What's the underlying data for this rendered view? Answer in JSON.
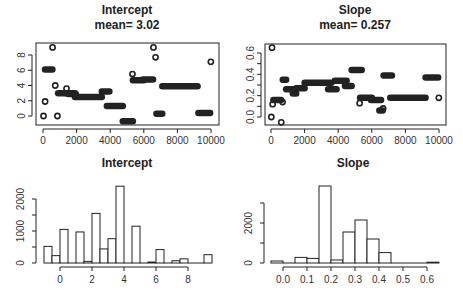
{
  "chart_data": [
    {
      "type": "scatter",
      "title": "Intercept",
      "subtitle": "mean= 3.02",
      "xlabel": "",
      "ylabel": "",
      "xlim": [
        0,
        10000
      ],
      "ylim": [
        -0.5,
        9.3
      ],
      "xticks": [
        0,
        2000,
        4000,
        6000,
        8000,
        10000
      ],
      "yticks": [
        0,
        2,
        4,
        6,
        8
      ],
      "grid": false,
      "segments": [
        {
          "x0": 0,
          "x1": 60,
          "y": 0.0
        },
        {
          "x0": 100,
          "x1": 150,
          "y": 1.9
        },
        {
          "x0": 120,
          "x1": 560,
          "y": 6.1
        },
        {
          "x0": 540,
          "x1": 600,
          "y": 9.0
        },
        {
          "x0": 680,
          "x1": 780,
          "y": 4.0
        },
        {
          "x0": 800,
          "x1": 920,
          "y": 0.0
        },
        {
          "x0": 900,
          "x1": 1900,
          "y": 3.0
        },
        {
          "x0": 1350,
          "x1": 1450,
          "y": 3.6
        },
        {
          "x0": 1500,
          "x1": 1950,
          "y": 2.9
        },
        {
          "x0": 1900,
          "x1": 3500,
          "y": 2.5
        },
        {
          "x0": 3500,
          "x1": 3950,
          "y": 3.2
        },
        {
          "x0": 3800,
          "x1": 4750,
          "y": 1.3
        },
        {
          "x0": 4750,
          "x1": 5350,
          "y": -0.7
        },
        {
          "x0": 5300,
          "x1": 5350,
          "y": 5.5
        },
        {
          "x0": 5350,
          "x1": 6000,
          "y": 4.7
        },
        {
          "x0": 5950,
          "x1": 6550,
          "y": 4.8
        },
        {
          "x0": 6500,
          "x1": 6650,
          "y": 9.0
        },
        {
          "x0": 6650,
          "x1": 6750,
          "y": 7.7
        },
        {
          "x0": 6750,
          "x1": 7100,
          "y": 0.3
        },
        {
          "x0": 7100,
          "x1": 9200,
          "y": 3.9
        },
        {
          "x0": 9250,
          "x1": 9950,
          "y": 0.4
        },
        {
          "x0": 9980,
          "x1": 10000,
          "y": 7.1
        }
      ]
    },
    {
      "type": "scatter",
      "title": "Slope",
      "subtitle": "mean= 0.257",
      "xlabel": "",
      "ylabel": "",
      "xlim": [
        0,
        10000
      ],
      "ylim": [
        -0.08,
        0.68
      ],
      "xticks": [
        0,
        2000,
        4000,
        6000,
        8000,
        10000
      ],
      "yticks": [
        0.0,
        0.2,
        0.4,
        0.6
      ],
      "ytick_minor": [
        0.1,
        0.3,
        0.5
      ],
      "grid": false,
      "segments": [
        {
          "x0": 0,
          "x1": 40,
          "y": 0.0
        },
        {
          "x0": 40,
          "x1": 80,
          "y": 0.65
        },
        {
          "x0": 80,
          "x1": 120,
          "y": 0.12
        },
        {
          "x0": 140,
          "x1": 600,
          "y": 0.16
        },
        {
          "x0": 580,
          "x1": 640,
          "y": -0.05
        },
        {
          "x0": 620,
          "x1": 760,
          "y": 0.14
        },
        {
          "x0": 700,
          "x1": 900,
          "y": 0.35
        },
        {
          "x0": 900,
          "x1": 1400,
          "y": 0.26
        },
        {
          "x0": 1300,
          "x1": 1500,
          "y": 0.22
        },
        {
          "x0": 1500,
          "x1": 2000,
          "y": 0.27
        },
        {
          "x0": 2000,
          "x1": 3600,
          "y": 0.32
        },
        {
          "x0": 3400,
          "x1": 3900,
          "y": 0.26
        },
        {
          "x0": 3800,
          "x1": 4500,
          "y": 0.34
        },
        {
          "x0": 4400,
          "x1": 4800,
          "y": 0.29
        },
        {
          "x0": 4800,
          "x1": 5400,
          "y": 0.44
        },
        {
          "x0": 5250,
          "x1": 5300,
          "y": 0.13
        },
        {
          "x0": 5300,
          "x1": 6000,
          "y": 0.18
        },
        {
          "x0": 5950,
          "x1": 6550,
          "y": 0.16
        },
        {
          "x0": 6450,
          "x1": 6650,
          "y": 0.06
        },
        {
          "x0": 6600,
          "x1": 6750,
          "y": 0.08
        },
        {
          "x0": 6700,
          "x1": 7200,
          "y": 0.39
        },
        {
          "x0": 7100,
          "x1": 9200,
          "y": 0.18
        },
        {
          "x0": 9200,
          "x1": 9950,
          "y": 0.37
        },
        {
          "x0": 9980,
          "x1": 10000,
          "y": 0.18
        }
      ]
    },
    {
      "type": "bar",
      "title": "Intercept",
      "xlabel": "Intercept",
      "ylabel": "Frequency",
      "xticks": [
        0,
        2,
        4,
        6,
        8
      ],
      "yticks": [
        0,
        1000,
        2000
      ],
      "ytick_minor": [
        500,
        1500
      ],
      "bin_width": 0.5,
      "bins": [
        {
          "x0": -1.0,
          "count": 520
        },
        {
          "x0": -0.5,
          "count": 230
        },
        {
          "x0": 0.0,
          "count": 1050
        },
        {
          "x0": 0.5,
          "count": 0
        },
        {
          "x0": 1.0,
          "count": 970
        },
        {
          "x0": 1.5,
          "count": 50
        },
        {
          "x0": 2.0,
          "count": 1550
        },
        {
          "x0": 2.5,
          "count": 440
        },
        {
          "x0": 3.0,
          "count": 760
        },
        {
          "x0": 3.5,
          "count": 2400
        },
        {
          "x0": 4.0,
          "count": 0
        },
        {
          "x0": 4.5,
          "count": 1150
        },
        {
          "x0": 5.0,
          "count": 0
        },
        {
          "x0": 5.5,
          "count": 30
        },
        {
          "x0": 6.0,
          "count": 420
        },
        {
          "x0": 6.5,
          "count": 0
        },
        {
          "x0": 7.0,
          "count": 70
        },
        {
          "x0": 7.5,
          "count": 130
        },
        {
          "x0": 8.0,
          "count": 0
        },
        {
          "x0": 8.5,
          "count": 0
        },
        {
          "x0": 9.0,
          "count": 260
        }
      ]
    },
    {
      "type": "bar",
      "title": "Slope",
      "xlabel": "Slope",
      "ylabel": "Frequency",
      "xticks": [
        0.0,
        0.1,
        0.2,
        0.3,
        0.4,
        0.5,
        0.6
      ],
      "yticks": [
        0,
        2000
      ],
      "ytick_minor": [
        1000,
        3000
      ],
      "bin_width": 0.05,
      "bins": [
        {
          "x0": -0.05,
          "count": 100
        },
        {
          "x0": 0.0,
          "count": 0
        },
        {
          "x0": 0.05,
          "count": 280
        },
        {
          "x0": 0.1,
          "count": 230
        },
        {
          "x0": 0.15,
          "count": 3850
        },
        {
          "x0": 0.2,
          "count": 150
        },
        {
          "x0": 0.25,
          "count": 1550
        },
        {
          "x0": 0.3,
          "count": 2150
        },
        {
          "x0": 0.35,
          "count": 1200
        },
        {
          "x0": 0.4,
          "count": 520
        },
        {
          "x0": 0.45,
          "count": 0
        },
        {
          "x0": 0.5,
          "count": 0
        },
        {
          "x0": 0.55,
          "count": 0
        },
        {
          "x0": 0.6,
          "count": 40
        }
      ]
    }
  ],
  "panels": {
    "trace_intercept": {
      "title": "Intercept",
      "subtitle": "mean= 3.02"
    },
    "trace_slope": {
      "title": "Slope",
      "subtitle": "mean= 0.257"
    },
    "hist_intercept": {
      "title": "Intercept"
    },
    "hist_slope": {
      "title": "Slope"
    }
  },
  "style": {
    "ink": "#222222",
    "background": "#ffffff"
  }
}
